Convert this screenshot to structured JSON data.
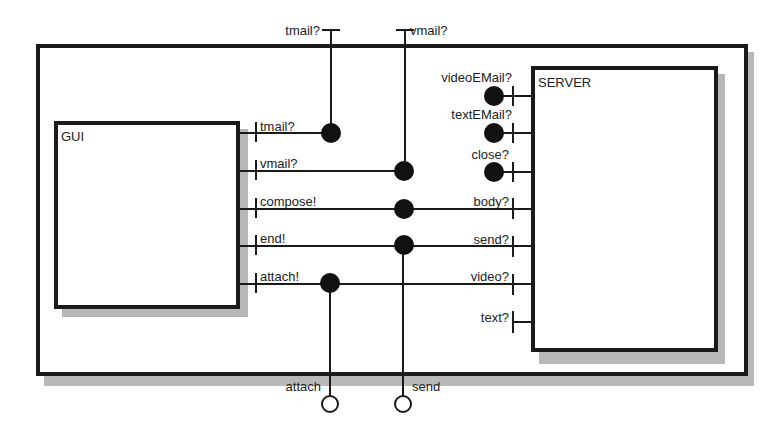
{
  "diagram": {
    "type": "component-connector",
    "outer_frame": {
      "label": ""
    },
    "components": [
      {
        "id": "gui",
        "label": "GUI"
      },
      {
        "id": "server",
        "label": "SERVER"
      }
    ],
    "external_ports": {
      "top": [
        {
          "id": "ext-tmail",
          "label": "tmail?"
        },
        {
          "id": "ext-vmail",
          "label": "vmail?"
        }
      ],
      "bottom": [
        {
          "id": "ext-attach",
          "label": "attach"
        },
        {
          "id": "ext-send",
          "label": "send"
        }
      ]
    },
    "gui_ports": [
      {
        "label": "tmail?"
      },
      {
        "label": "vmail?"
      },
      {
        "label": "compose!"
      },
      {
        "label": "end!"
      },
      {
        "label": "attach!"
      }
    ],
    "server_ports": [
      {
        "label": "videoEMail?"
      },
      {
        "label": "textEMail?"
      },
      {
        "label": "close?"
      },
      {
        "label": "body?"
      },
      {
        "label": "send?"
      },
      {
        "label": "video?"
      },
      {
        "label": "text?"
      }
    ],
    "connections": [
      {
        "from": "ext tmail?",
        "to": "GUI tmail?"
      },
      {
        "from": "ext vmail?",
        "to": "GUI vmail?"
      },
      {
        "from": "GUI compose!",
        "to": "SERVER body?"
      },
      {
        "from": "GUI end!",
        "to": "SERVER send?"
      },
      {
        "from": "GUI end!",
        "to": "ext send"
      },
      {
        "from": "GUI attach!",
        "to": "SERVER video?"
      },
      {
        "from": "GUI attach!",
        "to": "ext attach"
      }
    ]
  }
}
